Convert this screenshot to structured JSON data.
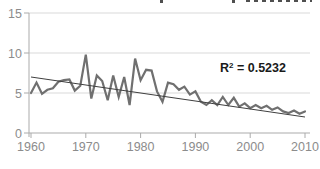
{
  "chart_data": {
    "type": "line",
    "title": "",
    "xlabel": "",
    "ylabel": "",
    "xlim": [
      1960,
      2010
    ],
    "ylim": [
      0,
      15
    ],
    "x_ticks": [
      1960,
      1970,
      1980,
      1990,
      2000,
      2010
    ],
    "y_ticks": [
      0,
      5,
      10,
      15
    ],
    "grid": "horizontal",
    "legend": "none",
    "x": [
      1960,
      1961,
      1962,
      1963,
      1964,
      1965,
      1966,
      1967,
      1968,
      1969,
      1970,
      1971,
      1972,
      1973,
      1974,
      1975,
      1976,
      1977,
      1978,
      1979,
      1980,
      1981,
      1982,
      1983,
      1984,
      1985,
      1986,
      1987,
      1988,
      1989,
      1990,
      1991,
      1992,
      1993,
      1994,
      1995,
      1996,
      1997,
      1998,
      1999,
      2000,
      2001,
      2002,
      2003,
      2004,
      2005,
      2006,
      2007,
      2008,
      2009,
      2010
    ],
    "series": [
      {
        "name": "annual-values",
        "values": [
          5.0,
          6.3,
          4.9,
          5.4,
          5.6,
          6.4,
          6.6,
          6.7,
          5.3,
          5.9,
          9.8,
          4.3,
          7.2,
          6.5,
          4.1,
          7.2,
          4.5,
          7.0,
          3.5,
          9.3,
          6.6,
          7.9,
          7.8,
          5.2,
          3.9,
          6.3,
          6.1,
          5.4,
          5.8,
          4.8,
          5.2,
          3.9,
          3.5,
          4.1,
          3.5,
          4.5,
          3.5,
          4.4,
          3.3,
          3.7,
          3.1,
          3.5,
          3.1,
          3.4,
          2.9,
          3.2,
          2.7,
          2.5,
          2.8,
          2.4,
          2.7
        ]
      }
    ],
    "trendline": {
      "type": "linear",
      "start_x": 1960,
      "start_value": 7.0,
      "end_x": 2010,
      "end_value": 2.0,
      "r_squared": 0.5232
    },
    "colors": {
      "series_line": "#707070",
      "trendline": "#3f3f3f",
      "gridline": "#d9d9d9",
      "axis_line": "#ababab",
      "tick_label": "#8c8c8c",
      "annotation_text": "#1a1a1a",
      "background": "#ffffff"
    }
  },
  "annotation": {
    "r2_base": "R",
    "r2_sup": "2",
    "r2_rest": " = 0.5232"
  }
}
